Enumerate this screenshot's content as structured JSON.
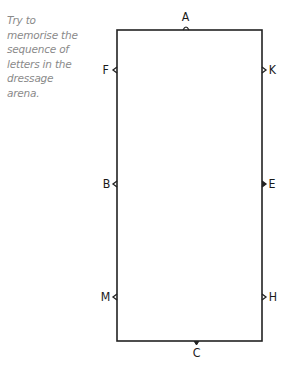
{
  "caption": {
    "lines": [
      "Try to",
      "memorise the",
      "sequence of",
      "letters in the",
      "dressage",
      "arena."
    ]
  },
  "arena": {
    "stroke_color": "#222222",
    "letters": {
      "top": "A",
      "bottom": "C",
      "left": [
        "F",
        "B",
        "M"
      ],
      "right": [
        "K",
        "E",
        "H"
      ]
    }
  }
}
